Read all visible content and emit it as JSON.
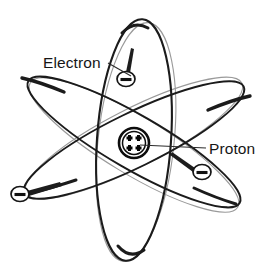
{
  "figure": {
    "background_color": "#ffffff",
    "width": 270,
    "height": 272,
    "ink_color": "#1b1b1b",
    "faint_ink_color": "#9a9a9a"
  },
  "labels": [
    {
      "id": "electron-label",
      "text": "Electron",
      "x": 43,
      "y": 68,
      "anchor": "start",
      "leader_from": [
        108,
        63
      ],
      "leader_to": [
        131,
        76
      ]
    },
    {
      "id": "proton-label",
      "text": "Proton",
      "x": 209,
      "y": 154,
      "anchor": "start",
      "leader_from": [
        206,
        148
      ],
      "leader_to": [
        140,
        145
      ]
    }
  ],
  "nucleus": {
    "name": "nucleus",
    "center_x": 134,
    "center_y": 143,
    "radius": 15,
    "proton_count": 4,
    "proton_symbol": "+",
    "charge_sign": "+"
  },
  "electrons": [
    {
      "id": "electron-top",
      "center_x": 126,
      "center_y": 79,
      "radius_x": 9,
      "radius_y": 7,
      "charge_sign": "-",
      "tail_angle": -70
    },
    {
      "id": "electron-right",
      "center_x": 202,
      "center_y": 172,
      "radius_x": 9,
      "radius_y": 7,
      "charge_sign": "-",
      "tail_angle": 214
    },
    {
      "id": "electron-lower-left",
      "center_x": 20,
      "center_y": 194,
      "radius_x": 9,
      "radius_y": 7,
      "charge_sign": "-",
      "tail_angle": 22
    }
  ],
  "orbits": [
    {
      "id": "orbit-vertical",
      "description": "tall narrow vertical ellipse",
      "center_x": 134,
      "center_y": 140,
      "radius_x": 37,
      "radius_y": 121,
      "rotation_deg": 4,
      "stroke_width": 2.1
    },
    {
      "id": "orbit-descending",
      "description": "ellipse tilted down to the right",
      "center_x": 134,
      "center_y": 142,
      "radius_x": 122,
      "radius_y": 27,
      "rotation_deg": 30,
      "stroke_width": 1.9
    },
    {
      "id": "orbit-ascending",
      "description": "ellipse tilted up to the right",
      "center_x": 134,
      "center_y": 140,
      "radius_x": 122,
      "radius_y": 27,
      "rotation_deg": -26,
      "stroke_width": 1.9
    }
  ]
}
